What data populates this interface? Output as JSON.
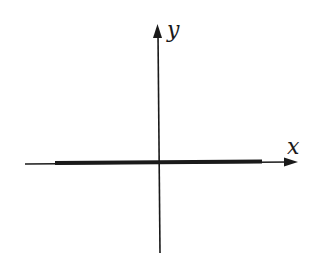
{
  "diagram": {
    "type": "coordinate-axes",
    "x_axis_label": "x",
    "y_axis_label": "y",
    "colors": {
      "background": "#ffffff",
      "ink": "#1a1a1a"
    },
    "geometry": {
      "origin": [
        159,
        163
      ],
      "x_axis": {
        "from": [
          25,
          163
        ],
        "to": [
          298,
          162
        ]
      },
      "y_axis": {
        "from": [
          159,
          253
        ],
        "to": [
          157,
          25
        ]
      },
      "thick_segment": {
        "from": [
          55,
          163
        ],
        "to": [
          262,
          162
        ],
        "stroke_width": 4
      }
    }
  }
}
